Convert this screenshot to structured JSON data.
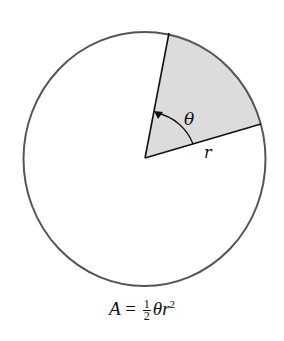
{
  "diagram": {
    "circle": {
      "cx": 144.5,
      "cy": 159,
      "rx": 121,
      "ry": 127,
      "stroke": "#555555"
    },
    "sector": {
      "center": [
        145,
        158
      ],
      "edge_point_top": [
        169,
        33
      ],
      "edge_point_right": [
        261,
        124
      ],
      "fill": "#dcdcdc"
    },
    "labels": {
      "angle": "θ",
      "radius": "r"
    },
    "formula": {
      "lhs": "A",
      "equals": "=",
      "numerator": "1",
      "denominator": "2",
      "theta": "θ",
      "r": "r",
      "exponent": "2"
    }
  }
}
